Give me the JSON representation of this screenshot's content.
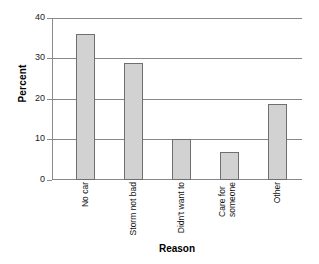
{
  "chart_data": {
    "type": "bar",
    "title": "",
    "categories": [
      "No car",
      "Storm not bad",
      "Didn't want to",
      "Care for someone",
      "Other"
    ],
    "values": [
      36,
      29,
      10,
      7,
      18.8
    ],
    "xlabel": "Reason",
    "ylabel": "Percent",
    "ylim": [
      0,
      40
    ],
    "yticks": [
      "0",
      "10",
      "20",
      "30",
      "40"
    ],
    "ytick_values": [
      0,
      10,
      20,
      30,
      40
    ],
    "grid": "horizontal",
    "legend": "none",
    "bar_fill": "#d2d2d2",
    "bar_edge": "#6f6f6f",
    "grid_color": "#888888"
  }
}
